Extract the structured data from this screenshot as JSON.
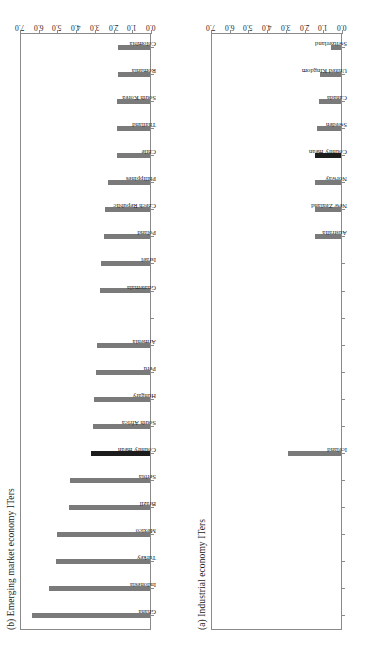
{
  "figure": {
    "orientation": "rotated-90",
    "bar_color": "#7a7a7a",
    "highlight_color": "#1c1c1c",
    "axis_color": "#8a8a8a"
  },
  "panels": [
    {
      "key": "emerging",
      "title": "(b) Emerging market economy ITers"
    },
    {
      "key": "industrial",
      "title": "(a) Industrial economy ITers"
    }
  ],
  "chart_data": [
    {
      "type": "bar",
      "title": "(b) Emerging market economy ITers",
      "xlabel": "",
      "ylabel": "",
      "ylim": [
        0.0,
        7.0
      ],
      "ytick_labels": [
        "0.0",
        "1.0",
        "2.0",
        "3.0",
        "4.0",
        "5.0",
        "6.0",
        "7.0"
      ],
      "ytick_values": [
        0.0,
        1.0,
        2.0,
        3.0,
        4.0,
        5.0,
        6.0,
        7.0
      ],
      "grid": false,
      "legend": "none",
      "highlight_category": "Country mean",
      "categories": [
        "Ghana",
        "Indonesia",
        "Turkey",
        "Mexico",
        "Brazil",
        "Serbia",
        "Country mean",
        "South Africa",
        "Hungary",
        "Peru",
        "Armenia",
        "",
        "Guatemala",
        "Israel",
        "Poland",
        "Czech Republic",
        "Philippines",
        "Chile",
        "Thailand",
        "South Korea",
        "Romania",
        "Colombia"
      ],
      "values": [
        6.3,
        5.4,
        5.0,
        4.95,
        4.35,
        4.3,
        3.15,
        3.05,
        3.0,
        2.9,
        2.85,
        0,
        2.65,
        2.6,
        2.45,
        2.4,
        2.25,
        1.75,
        1.75,
        1.75,
        1.7,
        1.7
      ]
    },
    {
      "type": "bar",
      "title": "(a) Industrial economy ITers",
      "xlabel": "",
      "ylabel": "",
      "ylim": [
        0.0,
        7.0
      ],
      "ytick_labels": [
        "0.0",
        "1.0",
        "2.0",
        "3.0",
        "4.0",
        "5.0",
        "6.0",
        "7.0"
      ],
      "ytick_values": [
        0.0,
        1.0,
        2.0,
        3.0,
        4.0,
        5.0,
        6.0,
        7.0
      ],
      "grid": false,
      "legend": "none",
      "highlight_category": "Country mean",
      "categories": [
        "",
        "",
        "",
        "",
        "",
        "",
        "Iceland",
        "",
        "",
        "",
        "",
        "",
        "",
        "",
        "Australia",
        "New Zealand",
        "Norway",
        "Country mean",
        "Sweden",
        "Canada",
        "United Kingdom",
        "Switzerland"
      ],
      "values": [
        0,
        0,
        0,
        0,
        0,
        0,
        2.85,
        0,
        0,
        0,
        0,
        0,
        0,
        0,
        1.4,
        1.4,
        1.4,
        1.4,
        1.3,
        1.2,
        1.1,
        0.55
      ]
    }
  ]
}
